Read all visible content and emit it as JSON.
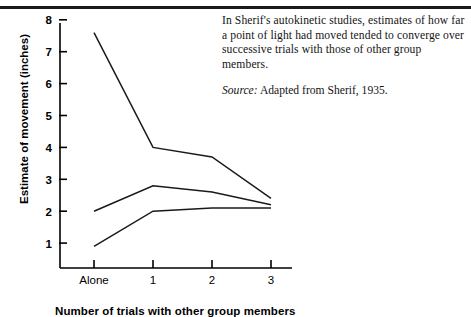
{
  "caption": {
    "body": "In Sherif's autokinetic studies, estimates of how far a point of light had moved tended to converge over successive trials with those of other group members.",
    "source_label": "Source:",
    "source_text": " Adapted from Sherif, 1935."
  },
  "chart_data": {
    "type": "line",
    "title": "",
    "xlabel": "Number of trials with other group members",
    "ylabel": "Estimate of movement (inches)",
    "categories": [
      "Alone",
      "1",
      "2",
      "3"
    ],
    "xtick_labels": [
      "Alone",
      "1",
      "2",
      "3"
    ],
    "ytick_labels": [
      "1",
      "2",
      "3",
      "4",
      "5",
      "6",
      "7",
      "8"
    ],
    "yticks": [
      1,
      2,
      3,
      4,
      5,
      6,
      7,
      8
    ],
    "ylim": [
      0,
      8.3
    ],
    "grid": false,
    "legend": "none",
    "series": [
      {
        "name": "Participant 1",
        "values": [
          7.6,
          4.0,
          3.7,
          2.4
        ]
      },
      {
        "name": "Participant 2",
        "values": [
          2.0,
          2.8,
          2.6,
          2.2
        ]
      },
      {
        "name": "Participant 3",
        "values": [
          0.9,
          2.0,
          2.1,
          2.1
        ]
      }
    ]
  }
}
